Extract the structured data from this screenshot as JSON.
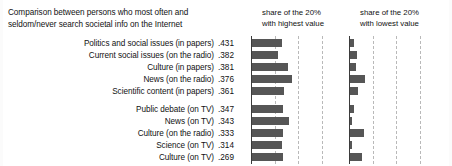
{
  "title": {
    "line1": "Comparison between persons who most often and",
    "line2": "seldom/never search societal info on the Internet"
  },
  "panels": {
    "high": {
      "line1": "share of the 20%",
      "line2": "with highest value"
    },
    "low": {
      "line1": "share of the 20%",
      "line2": "with lowest value"
    }
  },
  "chart_data": {
    "type": "bar",
    "title": "Comparison between persons who most often and seldom/never search societal info on the Internet",
    "orientation": "horizontal",
    "xlabel": "",
    "ylabel": "",
    "grid": true,
    "legend_position": "top",
    "panel_titles": [
      "share of the 20% with highest value",
      "share of the 20% with lowest value"
    ],
    "group_break_after_index": 4,
    "xlim_high": [
      0,
      0.8
    ],
    "xlim_low": [
      0,
      0.8
    ],
    "gridline_values": [
      0.2,
      0.4,
      0.6
    ],
    "categories": [
      "Politics and social issues (in papers)",
      "Current social issues (on the radio)",
      "Culture (in papers)",
      "News (on the radio)",
      "Scientific content (in papers)",
      "Public debate (on TV)",
      "News (on TV)",
      "Culture (on the radio)",
      "Science (on TV)",
      "Culture (on TV)"
    ],
    "value_labels": [
      ".431",
      ".382",
      ".381",
      ".376",
      ".361",
      ".347",
      ".343",
      ".333",
      ".314",
      ".269"
    ],
    "values": [
      0.431,
      0.382,
      0.381,
      0.376,
      0.361,
      0.347,
      0.343,
      0.333,
      0.314,
      0.269
    ],
    "series": [
      {
        "name": "share of the 20% with highest value",
        "values": [
          0.252,
          0.224,
          0.304,
          0.344,
          0.276,
          0.26,
          0.316,
          0.268,
          0.256,
          0.264
        ]
      },
      {
        "name": "share of the 20% with lowest value",
        "values": [
          0.032,
          0.06,
          0.048,
          0.124,
          0.072,
          0.032,
          0.016,
          0.116,
          0.02,
          0.104
        ]
      }
    ]
  }
}
